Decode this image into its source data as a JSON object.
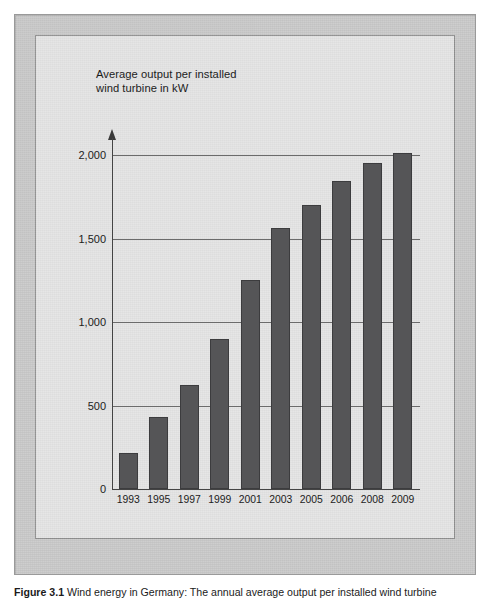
{
  "figure": {
    "caption_label": "Figure 3.1",
    "caption_text": "Wind energy in Germany: The annual average output per installed wind turbine"
  },
  "chart_data": {
    "type": "bar",
    "title": "Average output per installed\nwind turbine in kW",
    "xlabel": "",
    "ylabel": "",
    "categories": [
      "1993",
      "1995",
      "1997",
      "1999",
      "2001",
      "2003",
      "2005",
      "2006",
      "2008",
      "2009"
    ],
    "values": [
      215,
      430,
      620,
      900,
      1250,
      1560,
      1700,
      1845,
      1950,
      2010
    ],
    "ylim": [
      0,
      2000
    ],
    "yticks": [
      0,
      500,
      1000,
      1500,
      2000
    ],
    "ytick_labels": [
      "0",
      "500",
      "1,000",
      "1,500",
      "2,000"
    ],
    "grid": true,
    "legend": false,
    "bar_color": "#555557",
    "panel_color": "#e4e4e4",
    "frame_color": "#c9c9c9",
    "axis_color": "#444444"
  }
}
